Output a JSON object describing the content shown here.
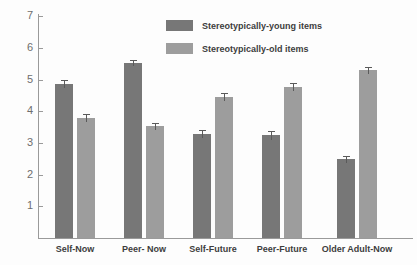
{
  "chart_data": {
    "type": "bar",
    "title": "",
    "subtitle": "",
    "xlabel": "",
    "ylabel": "",
    "ylim": [
      0,
      7
    ],
    "yticks": [
      1,
      2,
      3,
      4,
      5,
      6,
      7
    ],
    "grid": false,
    "legend_position": "top-center",
    "categories": [
      "Self-Now",
      "Peer- Now",
      "Self-Future",
      "Peer-Future",
      "Older Adult-Now"
    ],
    "series": [
      {
        "name": "Stereotypically-young items",
        "color": "#777777",
        "values": [
          4.87,
          5.52,
          3.28,
          3.24,
          2.48
        ],
        "errors": [
          0.13,
          0.1,
          0.12,
          0.15,
          0.12
        ]
      },
      {
        "name": "Stereotypically-old items",
        "color": "#9d9d9d",
        "values": [
          3.78,
          3.53,
          4.45,
          4.78,
          5.29
        ],
        "errors": [
          0.13,
          0.11,
          0.13,
          0.13,
          0.1
        ]
      }
    ]
  },
  "legend": {
    "items": [
      {
        "label": "Stereotypically-young items",
        "color": "#777777"
      },
      {
        "label": "Stereotypically-old items",
        "color": "#9d9d9d"
      }
    ]
  },
  "axis": {
    "y_tick_labels": [
      "7",
      "6",
      "5",
      "4",
      "3",
      "2",
      "1"
    ],
    "axis_color": "#9a9a9a",
    "tick_text_color": "#6e6e6e"
  }
}
